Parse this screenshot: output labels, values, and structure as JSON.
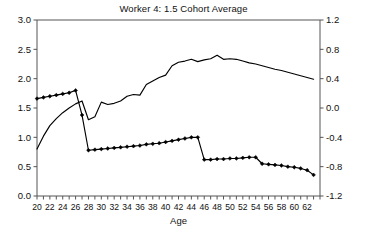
{
  "chart_data": {
    "type": "line",
    "title": "Worker 4: 1.5 Cohort Average",
    "xlabel": "Age",
    "ylabel": "",
    "y2label": "",
    "xlim": [
      20,
      64
    ],
    "ylim": [
      0.0,
      3.0
    ],
    "y2lim": [
      -1.2,
      1.2
    ],
    "grid": false,
    "legend": "none",
    "xticks": [
      20,
      21,
      22,
      23,
      24,
      25,
      26,
      27,
      28,
      29,
      30,
      31,
      32,
      33,
      34,
      35,
      36,
      37,
      38,
      39,
      40,
      41,
      42,
      43,
      44,
      45,
      46,
      47,
      48,
      49,
      50,
      51,
      52,
      53,
      54,
      55,
      56,
      57,
      58,
      59,
      60,
      61,
      62,
      63,
      64
    ],
    "xticklabels": [
      "20",
      "22",
      "24",
      "26",
      "28",
      "30",
      "32",
      "34",
      "36",
      "38",
      "40",
      "42",
      "44",
      "46",
      "48",
      "50",
      "52",
      "54",
      "56",
      "58",
      "60",
      "62"
    ],
    "xticklabel_values": [
      20,
      22,
      24,
      26,
      28,
      30,
      32,
      34,
      36,
      38,
      40,
      42,
      44,
      46,
      48,
      50,
      52,
      54,
      56,
      58,
      60,
      62
    ],
    "yticks": [
      0.0,
      0.5,
      1.0,
      1.5,
      2.0,
      2.5,
      3.0
    ],
    "yticklabels": [
      "0.0",
      "0.5",
      "1.0",
      "1.5",
      "2.0",
      "2.5",
      "3.0"
    ],
    "y2ticks": [
      -1.2,
      -0.8,
      -0.4,
      0.0,
      0.4,
      0.8,
      1.2
    ],
    "y2ticklabels": [
      "-1.2",
      "-0.8",
      "-0.4",
      "0.0",
      "0.4",
      "0.8",
      "1.2"
    ],
    "x": [
      20,
      21,
      22,
      23,
      24,
      25,
      26,
      27,
      28,
      29,
      30,
      31,
      32,
      33,
      34,
      35,
      36,
      37,
      38,
      39,
      40,
      41,
      42,
      43,
      44,
      45,
      46,
      47,
      48,
      49,
      50,
      51,
      52,
      53,
      54,
      55,
      56,
      57,
      58,
      59,
      60,
      61,
      62,
      63
    ],
    "series": [
      {
        "name": "marked-series",
        "axis": "left",
        "marker": "diamond",
        "values": [
          1.66,
          1.68,
          1.7,
          1.72,
          1.74,
          1.76,
          1.8,
          1.38,
          0.78,
          0.79,
          0.8,
          0.81,
          0.82,
          0.83,
          0.84,
          0.85,
          0.86,
          0.88,
          0.89,
          0.9,
          0.92,
          0.94,
          0.96,
          0.98,
          1.0,
          1.0,
          0.62,
          0.62,
          0.63,
          0.63,
          0.64,
          0.64,
          0.65,
          0.66,
          0.66,
          0.55,
          0.54,
          0.53,
          0.52,
          0.5,
          0.49,
          0.47,
          0.44,
          0.36
        ]
      },
      {
        "name": "unmarked-series",
        "axis": "left",
        "marker": "none",
        "values": [
          0.8,
          1.02,
          1.2,
          1.32,
          1.42,
          1.5,
          1.57,
          1.62,
          1.3,
          1.35,
          1.6,
          1.56,
          1.58,
          1.62,
          1.7,
          1.73,
          1.72,
          1.9,
          1.96,
          2.02,
          2.06,
          2.22,
          2.28,
          2.3,
          2.33,
          2.29,
          2.32,
          2.34,
          2.4,
          2.33,
          2.34,
          2.33,
          2.3,
          2.27,
          2.25,
          2.22,
          2.19,
          2.16,
          2.14,
          2.11,
          2.08,
          2.05,
          2.02,
          1.99
        ]
      }
    ]
  }
}
